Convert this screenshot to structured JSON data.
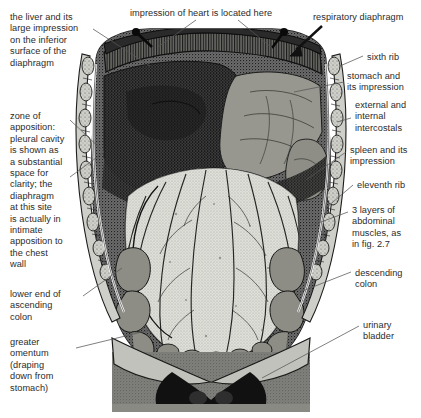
{
  "figure": {
    "style": "grayscale engraving / halftone anatomical illustration",
    "background_color": "#ffffff",
    "text_color": "#2b2b2b",
    "leader_line_color": "#555555",
    "width": 421,
    "height": 418
  },
  "labels": [
    {
      "id": "liver-impression",
      "text": "the liver and its\nlarge impression\non the inferior\nsurface of the\ndiaphragm",
      "x": 10,
      "y": 12,
      "align": "left"
    },
    {
      "id": "heart-impression",
      "text": "impression of heart is located here",
      "x": 130,
      "y": 8,
      "align": "left"
    },
    {
      "id": "respiratory-diaphragm",
      "text": "respiratory diaphragm",
      "x": 313,
      "y": 12,
      "align": "left"
    },
    {
      "id": "sixth-rib",
      "text": "sixth rib",
      "x": 367,
      "y": 52,
      "align": "left"
    },
    {
      "id": "stomach-impression",
      "text": "stomach and\nits impression",
      "x": 347,
      "y": 71,
      "align": "left"
    },
    {
      "id": "intercostals",
      "text": "external and\ninternal\nintercostals",
      "x": 355,
      "y": 100,
      "align": "left"
    },
    {
      "id": "spleen-impression",
      "text": "spleen and its\nimpression",
      "x": 350,
      "y": 145,
      "align": "left"
    },
    {
      "id": "eleventh-rib",
      "text": "eleventh rib",
      "x": 357,
      "y": 180,
      "align": "left"
    },
    {
      "id": "abdominal-muscles",
      "text": "3 layers of\nabdominal\nmuscles, as\nin fig. 2.7",
      "x": 352,
      "y": 205,
      "align": "left"
    },
    {
      "id": "zone-of-apposition",
      "text": "zone of\napposition:\npleural cavity\nis shown as\na substantial\nspace for\nclarity; the\ndiaphragm\nat this site\nis actually in\nintimate\napposition to\nthe chest\nwall",
      "x": 10,
      "y": 111,
      "align": "left"
    },
    {
      "id": "descending-colon",
      "text": "descending\ncolon",
      "x": 355,
      "y": 268,
      "align": "left"
    },
    {
      "id": "ascending-colon",
      "text": "lower end of\nascending\ncolon",
      "x": 10,
      "y": 289,
      "align": "left"
    },
    {
      "id": "urinary-bladder",
      "text": "urinary\nbladder",
      "x": 363,
      "y": 320,
      "align": "left"
    },
    {
      "id": "greater-omentum",
      "text": "greater\nomentum\n(draping\ndown from\nstomach)",
      "x": 10,
      "y": 337,
      "align": "left"
    }
  ],
  "anatomy_regions": [
    {
      "name": "respiratory-diaphragm-crest",
      "tone": "dark-hatched"
    },
    {
      "name": "liver-impression-area",
      "tone": "dark-stippled"
    },
    {
      "name": "stomach-impression-area",
      "tone": "mid-gray"
    },
    {
      "name": "spleen-impression-area",
      "tone": "mid-gray"
    },
    {
      "name": "greater-omentum",
      "tone": "light-with-vessels"
    },
    {
      "name": "ascending-colon",
      "tone": "mid-gray-nodular"
    },
    {
      "name": "descending-colon",
      "tone": "mid-gray-nodular"
    },
    {
      "name": "urinary-bladder",
      "tone": "dark"
    },
    {
      "name": "rib-cage-left",
      "tone": "segmented-light"
    },
    {
      "name": "rib-cage-right",
      "tone": "segmented-light"
    },
    {
      "name": "abdominal-wall",
      "tone": "light-gray"
    }
  ]
}
